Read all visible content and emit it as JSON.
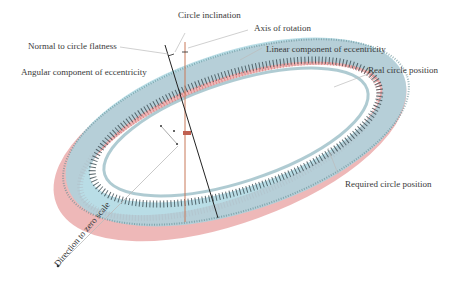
{
  "diagram": {
    "labels": {
      "circle_inclination": "Circle inclination",
      "axis_of_rotation": "Axis of rotation",
      "normal_to_circle_flatness": "Normal to circle flatness",
      "linear_component": "Linear component of eccentricity",
      "angular_component": "Angular component of eccentricity",
      "real_circle_position": "Real circle position",
      "required_circle_position": "Required circle position",
      "direction_to_zero_scale": "Direction to zero scale"
    },
    "colors": {
      "required_ring": "#e8a0a0",
      "real_ring": "#a8d4e0",
      "ticks": "#2a2a2a",
      "axis_line": "#c87858",
      "normal_line": "#222222",
      "leader": "#bbbbbb"
    }
  }
}
